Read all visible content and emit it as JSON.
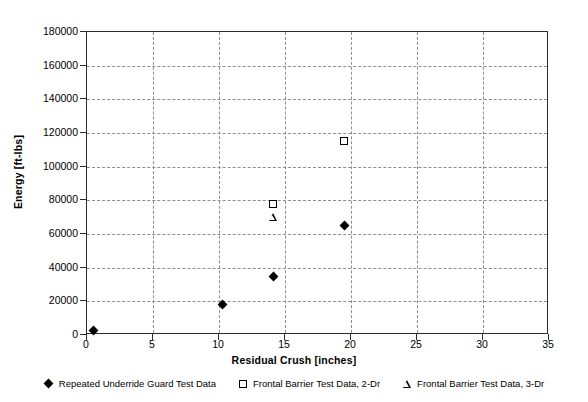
{
  "chart_data": {
    "type": "scatter",
    "title": "",
    "xlabel": "Residual Crush [inches]",
    "ylabel": "Energy [ft-lbs]",
    "xlim": [
      0,
      35
    ],
    "ylim": [
      0,
      180000
    ],
    "xticks": [
      0,
      5,
      10,
      15,
      20,
      25,
      30,
      35
    ],
    "yticks": [
      0,
      20000,
      40000,
      60000,
      80000,
      100000,
      120000,
      140000,
      160000,
      180000
    ],
    "xtick_labels": [
      "0",
      "5",
      "10",
      "15",
      "20",
      "25",
      "30",
      "35"
    ],
    "ytick_labels": [
      "0",
      "20000",
      "40000",
      "60000",
      "80000",
      "100000",
      "120000",
      "140000",
      "160000",
      "180000"
    ],
    "grid": true,
    "grid_style": "dashed",
    "legend_position": "bottom",
    "series": [
      {
        "name": "Repeated Underride Guard Test Data",
        "marker": "diamond",
        "marker_fill": "#000000",
        "points": [
          {
            "x": 0.5,
            "y": 2500
          },
          {
            "x": 10.3,
            "y": 18000
          },
          {
            "x": 14.1,
            "y": 35000
          },
          {
            "x": 19.5,
            "y": 65000
          }
        ]
      },
      {
        "name": "Frontal Barrier Test Data, 2-Dr",
        "marker": "square",
        "marker_fill": "#ffffff",
        "points": [
          {
            "x": 14.1,
            "y": 78000
          },
          {
            "x": 19.5,
            "y": 115000
          }
        ]
      },
      {
        "name": "Frontal Barrier Test Data, 3-Dr",
        "marker": "triangle",
        "marker_fill": "#ffffff",
        "points": [
          {
            "x": 14.1,
            "y": 70000
          }
        ]
      }
    ]
  },
  "colors": {
    "axis": "#2b2b2b",
    "grid": "#8e8e8e",
    "marker": "#000000",
    "background": "#ffffff"
  }
}
